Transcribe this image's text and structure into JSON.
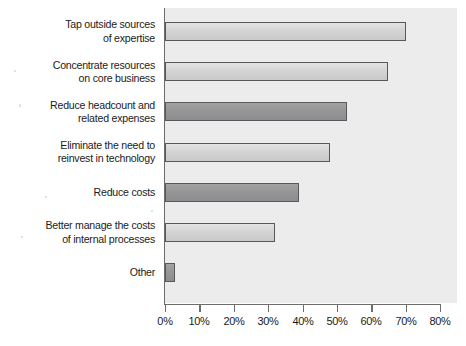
{
  "chart_data": {
    "type": "bar",
    "orientation": "horizontal",
    "title": "",
    "xlabel": "",
    "ylabel": "",
    "xlim": [
      0,
      80
    ],
    "grid": false,
    "legend": null,
    "axis_unit": "%",
    "categories": [
      "Tap outside sources\nof expertise",
      "Concentrate resources\non core business",
      "Reduce headcount and\nrelated expenses",
      "Eliminate the need to\nreinvest in technology",
      "Reduce costs",
      "Better manage the costs\nof internal processes",
      "Other"
    ],
    "values": [
      70,
      65,
      53,
      48,
      39,
      32,
      3
    ],
    "bar_shades": [
      "light",
      "light",
      "dark",
      "light",
      "dark",
      "light",
      "dark"
    ],
    "tick_labels": [
      "0%",
      "10%",
      "20%",
      "30%",
      "40%",
      "50%",
      "60%",
      "70%",
      "80%"
    ],
    "tick_values": [
      0,
      10,
      20,
      30,
      40,
      50,
      60,
      70,
      80
    ]
  },
  "colors": {
    "plot_background": "#ececed",
    "axis": "#6d6d6d",
    "bar_border": "#58585a",
    "bar_light": "#d4d4d5",
    "bar_dark": "#969698",
    "text": "#1b1b1b",
    "page_background": "#ffffff"
  }
}
